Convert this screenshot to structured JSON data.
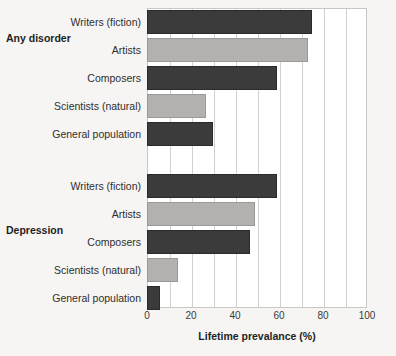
{
  "chart_data": {
    "type": "bar",
    "orientation": "horizontal",
    "title": "",
    "xlabel": "Lifetime prevalance (%)",
    "ylabel": "",
    "xlim": [
      0,
      100
    ],
    "xticks": [
      0,
      20,
      40,
      60,
      80,
      100
    ],
    "xtick_labels": [
      "0",
      "20",
      "40",
      "60",
      "80",
      "100"
    ],
    "gridlines": [
      10,
      20,
      30,
      40,
      50,
      60,
      70,
      80,
      90
    ],
    "grid": true,
    "legend": "none",
    "categories": [
      "Writers (fiction)",
      "Artists",
      "Composers",
      "Scientists (natural)",
      "General population"
    ],
    "groups": [
      {
        "name": "Any disorder",
        "values": [
          75,
          73,
          59,
          27,
          30
        ],
        "colors": [
          "#3b3b3b",
          "#b2b1af",
          "#3b3b3b",
          "#b2b1af",
          "#3b3b3b"
        ]
      },
      {
        "name": "Depression",
        "values": [
          59,
          49,
          47,
          14,
          6
        ],
        "colors": [
          "#3b3b3b",
          "#b2b1af",
          "#3b3b3b",
          "#b2b1af",
          "#3b3b3b"
        ]
      }
    ]
  },
  "colors": {
    "bar_dark": "#3b3b3b",
    "bar_light": "#b2b1af",
    "background": "#f6f5f3",
    "plot_background": "#ffffff",
    "gridline": "#d3d1ce",
    "text": "#2e2e2e"
  }
}
